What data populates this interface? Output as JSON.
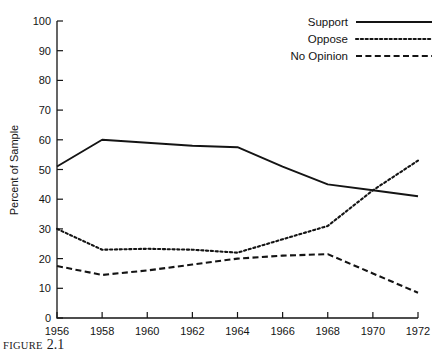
{
  "figure": {
    "caption_label": "FIGURE",
    "caption_number": "2.1"
  },
  "chart_data": {
    "type": "line",
    "title": "",
    "xlabel": "",
    "ylabel": "Percent of Sample",
    "xlim": [
      1956,
      1972
    ],
    "ylim": [
      0,
      100
    ],
    "grid": false,
    "legend_position": "top-right",
    "x": [
      1956,
      1958,
      1960,
      1962,
      1964,
      1966,
      1968,
      1970,
      1972
    ],
    "xticklabels": [
      "1956",
      "1958",
      "1960",
      "1962",
      "1964",
      "1966",
      "1968",
      "1970",
      "1972"
    ],
    "yticks": [
      0,
      10,
      20,
      30,
      40,
      50,
      60,
      70,
      80,
      90,
      100
    ],
    "yticklabels": [
      "0",
      "10",
      "20",
      "30",
      "40",
      "50",
      "60",
      "70",
      "80",
      "90",
      "100"
    ],
    "series": [
      {
        "name": "Support",
        "style": "solid",
        "values": [
          51,
          60,
          59,
          58,
          57.5,
          51,
          45,
          43,
          41
        ]
      },
      {
        "name": "Oppose",
        "style": "dotted",
        "values": [
          30,
          23,
          23.3,
          23,
          22,
          26.5,
          31,
          43,
          53
        ]
      },
      {
        "name": "No Opinion",
        "style": "dashed",
        "values": [
          17.5,
          14.5,
          16,
          18,
          20,
          21,
          21.5,
          15,
          8.5
        ]
      }
    ]
  },
  "legend": {
    "entries": [
      {
        "label": "Support",
        "style": "solid"
      },
      {
        "label": "Oppose",
        "style": "dotted"
      },
      {
        "label": "No Opinion",
        "style": "dashed"
      }
    ]
  }
}
